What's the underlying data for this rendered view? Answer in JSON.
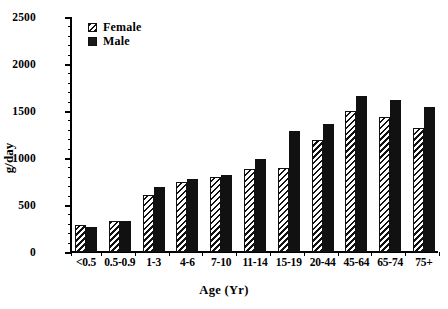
{
  "chart_data": {
    "type": "bar",
    "title": "",
    "xlabel": "Age (Yr)",
    "ylabel": "g/day",
    "ylim": [
      0,
      2500
    ],
    "ytick_labels": [
      "0",
      "500",
      "1000",
      "1500",
      "2000",
      "2500"
    ],
    "ytick_values": [
      0,
      500,
      1000,
      1500,
      2000,
      2500
    ],
    "minor_tick_interval": 100,
    "grid": false,
    "legend_position": "top-left",
    "categories": [
      "<0.5",
      "0.5-0.9",
      "1-3",
      "4-6",
      "7-10",
      "11-14",
      "15-19",
      "20-44",
      "45-64",
      "65-74",
      "75+"
    ],
    "series": [
      {
        "name": "Female",
        "fill": "hatched",
        "color": "#111111",
        "values": [
          290,
          335,
          610,
          740,
          800,
          885,
          895,
          1195,
          1500,
          1440,
          1320
        ]
      },
      {
        "name": "Male",
        "fill": "solid",
        "color": "#111111",
        "values": [
          265,
          325,
          690,
          775,
          820,
          985,
          1290,
          1360,
          1655,
          1620,
          1540
        ]
      }
    ]
  },
  "legend": {
    "items": [
      {
        "label": "Female",
        "swatch": "hatched-swatch"
      },
      {
        "label": "Male",
        "swatch": "solid-swatch"
      }
    ]
  }
}
